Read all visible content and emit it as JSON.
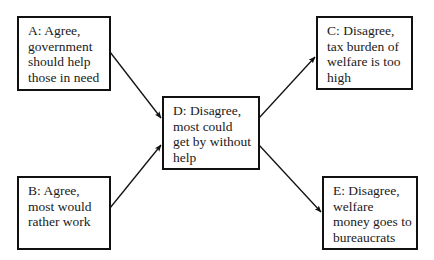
{
  "diagram": {
    "nodes": [
      {
        "id": "A",
        "lines": [
          "A:  Agree,",
          "government",
          "should help",
          "those in need"
        ],
        "label": "A:  Agree, government should help those in need"
      },
      {
        "id": "B",
        "lines": [
          "B:  Agree,",
          "most would",
          "rather work"
        ],
        "label": "B:  Agree, most would rather work"
      },
      {
        "id": "C",
        "lines": [
          "C:  Disagree,",
          "tax burden of",
          "welfare is too",
          "high"
        ],
        "label": "C:  Disagree, tax burden of welfare is too high"
      },
      {
        "id": "D",
        "lines": [
          "D:  Disagree,",
          "most could",
          "get by without",
          "help"
        ],
        "label": "D:  Disagree, most could get by without help"
      },
      {
        "id": "E",
        "lines": [
          "E:  Disagree,",
          "welfare",
          "money goes to",
          "bureaucrats"
        ],
        "label": "E:  Disagree, welfare money goes to bureaucrats"
      }
    ],
    "edges": [
      {
        "from": "A",
        "to": "D"
      },
      {
        "from": "B",
        "to": "D"
      },
      {
        "from": "D",
        "to": "C"
      },
      {
        "from": "D",
        "to": "E"
      }
    ],
    "colors": {
      "stroke": "#111111",
      "text": "#1a1a1a",
      "background": "#ffffff"
    }
  }
}
